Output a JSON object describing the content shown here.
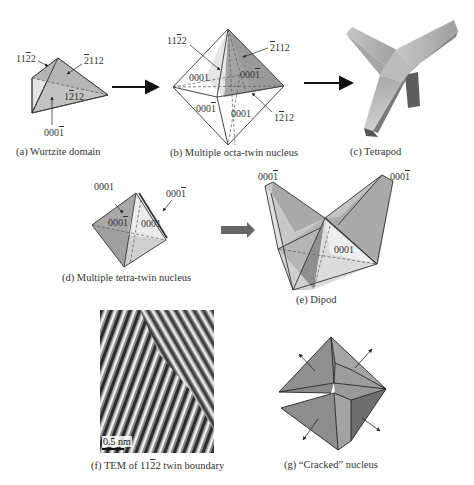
{
  "figure": {
    "panels": [
      {
        "id": "a",
        "caption": "(a) Wurtzite domain",
        "labels": [
          "11̅2̅2",
          "̅2112",
          "1̅2̅ 12",
          "000̅1"
        ]
      },
      {
        "id": "b",
        "caption": "(b) Multiple octa-twin nucleus",
        "labels": [
          "11̅2̅2",
          "̅2112",
          "0001",
          "000̅1",
          "000̅1",
          "0001",
          "1̅2̅ 12"
        ]
      },
      {
        "id": "c",
        "caption": "(c) Tetrapod"
      },
      {
        "id": "d",
        "caption": "(d) Multiple tetra-twin nucleus",
        "labels": [
          "0001",
          "000̅1",
          "000̅1",
          "0001"
        ]
      },
      {
        "id": "e",
        "caption": "(e) Dipod",
        "labels": [
          "000̅1",
          "000̅1",
          "0001"
        ]
      },
      {
        "id": "f",
        "caption": "(f) TEM of 11̅2̅2 twin boundary",
        "scale_bar": "0.5 nm"
      },
      {
        "id": "g",
        "caption": "(g) “Cracked” nucleus"
      }
    ]
  },
  "text": {
    "a_caption": "(a) Wurtzite domain",
    "b_caption": "(b) Multiple octa-twin nucleus",
    "c_caption": "(c) Tetrapod",
    "d_caption": "(d) Multiple tetra-twin nucleus",
    "e_caption": "(e) Dipod",
    "f_caption_pre": "(f) TEM of 11",
    "f_caption_bar": "2",
    "f_caption_post": "2 twin boundary",
    "g_caption": "(g) “Cracked” nucleus",
    "scale": "0.5 nm",
    "a_lbl1_pre": "11",
    "a_lbl1_bar": "2",
    "a_lbl1_post": "2",
    "a_lbl2_bar": "2",
    "a_lbl2_post": "112",
    "a_lbl3_pre": "1",
    "a_lbl3_bar": "2",
    "a_lbl3_post": "12",
    "a_lbl4_pre": "000",
    "a_lbl4_bar": "1",
    "b_lbl1_pre": "11",
    "b_lbl1_bar": "2",
    "b_lbl1_post": "2",
    "b_lbl2_bar": "2",
    "b_lbl2_post": "112",
    "b_lbl3": "0001",
    "b_lbl4_pre": "000",
    "b_lbl4_bar": "1",
    "b_lbl5_pre": "000",
    "b_lbl5_bar": "1",
    "b_lbl6": "0001",
    "b_lbl7_pre": "1",
    "b_lbl7_bar": "2",
    "b_lbl7_post": "12",
    "d_lbl1": "0001",
    "d_lbl2_pre": "000",
    "d_lbl2_bar": "1",
    "d_lbl3_pre": "000",
    "d_lbl3_bar": "1",
    "d_lbl4": "0001",
    "e_lbl1_pre": "000",
    "e_lbl1_bar": "1",
    "e_lbl2_pre": "000",
    "e_lbl2_bar": "1",
    "e_lbl3": "0001"
  },
  "colors": {
    "face_light": "#e6e6e6",
    "face_mid": "#c4c4c4",
    "face_dark": "#9a9a9a",
    "face_darker": "#7d7d7d",
    "edge": "#333333",
    "arrow": "#111111",
    "arrow_gray": "#666666"
  }
}
